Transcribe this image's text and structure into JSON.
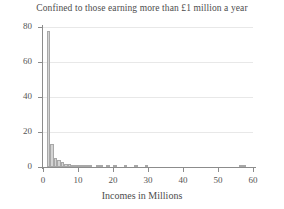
{
  "chart_data": {
    "type": "bar",
    "title": "Confined to those earning more than £1 million a year",
    "subtitle": "",
    "xlabel": "Incomes in Millions",
    "ylabel": "",
    "xlim": [
      0,
      60
    ],
    "ylim": [
      0,
      80
    ],
    "grid": true,
    "legend": null,
    "x_ticks": [
      0,
      10,
      20,
      30,
      40,
      50,
      60
    ],
    "x_tick_labels": [
      "0",
      "10",
      "20",
      "30",
      "40",
      "50",
      "60"
    ],
    "y_ticks": [
      0,
      20,
      40,
      60,
      80
    ],
    "y_tick_labels": [
      "0",
      "20",
      "40",
      "60",
      "80"
    ],
    "bin_width": 1,
    "bar_fill": "#d4d4d4",
    "bar_edge": "#a8a8a8",
    "categories": [
      "1-2",
      "2-3",
      "3-4",
      "4-5",
      "5-6",
      "6-7",
      "7-8",
      "8-9",
      "9-10",
      "10-11",
      "11-12",
      "12-13",
      "13-14",
      "14-15",
      "15-16",
      "16-17",
      "17-18",
      "18-19",
      "19-20",
      "20-21",
      "21-22",
      "22-23",
      "23-24",
      "24-25",
      "25-26",
      "26-27",
      "27-28",
      "28-29",
      "29-30",
      "30-31",
      "56-57",
      "57-58"
    ],
    "bins_left": [
      1,
      2,
      3,
      4,
      5,
      6,
      7,
      8,
      9,
      10,
      11,
      12,
      13,
      14,
      15,
      16,
      17,
      18,
      19,
      20,
      21,
      22,
      23,
      24,
      25,
      26,
      27,
      28,
      29,
      30,
      56,
      57
    ],
    "values": [
      78,
      13,
      5,
      4,
      3,
      2,
      2,
      1,
      1,
      1,
      1,
      1,
      1,
      0,
      1,
      1,
      0,
      1,
      0,
      1,
      0,
      0,
      1,
      0,
      0,
      1,
      0,
      0,
      1,
      0,
      1,
      1
    ]
  },
  "axes": {
    "x_title": "Incomes in Millions"
  }
}
